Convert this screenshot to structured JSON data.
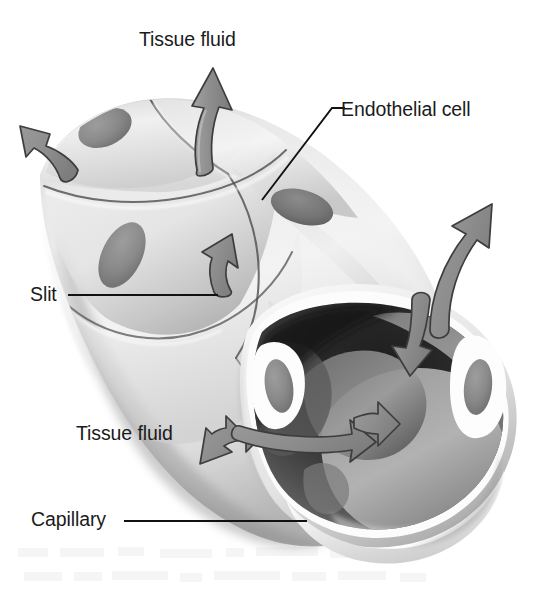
{
  "figure": {
    "subject": "capillary",
    "style": "grayscale airbrush biological illustration",
    "background_color": "#ffffff",
    "width": 548,
    "height": 592
  },
  "labels": {
    "tissue_fluid_top": "Tissue fluid",
    "endothelial_cell": "Endothelial cell",
    "slit": "Slit",
    "tissue_fluid_bottom": "Tissue fluid",
    "capillary": "Capillary"
  },
  "colors": {
    "label_text": "#1b1b1b",
    "leader_line": "#111111",
    "arrow_fill": "#8f8f8f",
    "arrow_outline": "#3a3a3a",
    "wall_light": "#efefef",
    "wall_mid": "#d2d2d2",
    "wall_shadow": "#9e9e9e",
    "nucleus": "#8a8a8a",
    "lumen_dark": "#262626",
    "lumen_mid": "#6f6f6f",
    "rim_highlight": "#fbfbfb",
    "cell_boundary": "#4a4a4a"
  },
  "leader_lines": [
    {
      "name": "endothelial-cell-leader",
      "from_x": 341,
      "from_y": 108,
      "to_x": 262,
      "to_y": 200
    },
    {
      "name": "slit-leader",
      "from_x": 68,
      "from_y": 295,
      "to_x": 218,
      "to_y": 295
    },
    {
      "name": "capillary-leader",
      "from_x": 124,
      "from_y": 521,
      "to_x": 307,
      "to_y": 521
    }
  ],
  "arrows": [
    {
      "name": "arrow-tissue-fluid-up",
      "direction": "up",
      "heads": 1,
      "meaning": "fluid leaving capillary through slit"
    },
    {
      "name": "arrow-upper-left-out",
      "direction": "up-left",
      "heads": 1,
      "meaning": "fluid leaving capillary through slit"
    },
    {
      "name": "arrow-mid-slit-out",
      "direction": "up-right",
      "heads": 1,
      "meaning": "fluid leaving capillary through slit"
    },
    {
      "name": "arrow-right-bidirectional",
      "direction": "up-right-and-down",
      "heads": 2,
      "meaning": "fluid exchange across the capillary wall"
    },
    {
      "name": "arrow-lumen-bidirectional",
      "direction": "left-and-right",
      "heads": 2,
      "meaning": "fluid exchange between lumen and tissue"
    }
  ],
  "structures": {
    "endothelial_cells": 7,
    "nuclei_visible": 6,
    "slits_visible": 5,
    "lumen": "open cut end of capillary, dark interior"
  }
}
